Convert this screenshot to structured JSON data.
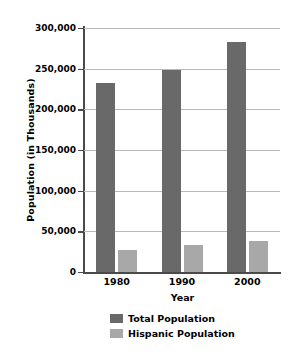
{
  "chart_data": {
    "type": "bar",
    "title": "",
    "xlabel": "Year",
    "ylabel": "Population (in Thousands)",
    "categories": [
      "1980",
      "1990",
      "2000"
    ],
    "series": [
      {
        "name": "Total Population",
        "color": "#696969",
        "values": [
          232000,
          248000,
          283000
        ]
      },
      {
        "name": "Hispanic Population",
        "color": "#a8a8a8",
        "values": [
          27000,
          33000,
          38000
        ]
      }
    ],
    "ylim": [
      0,
      300000
    ],
    "yticks": [
      0,
      50000,
      100000,
      150000,
      200000,
      250000,
      300000
    ],
    "ytick_labels": [
      "0",
      "50,000",
      "100,000",
      "150,000",
      "200,000",
      "250,000",
      "300,000"
    ],
    "grid": true,
    "legend_position": "bottom",
    "background_color": "#ffffff",
    "gridline_color": "#b9b9b9",
    "axis_color": "#4a4a4a"
  }
}
